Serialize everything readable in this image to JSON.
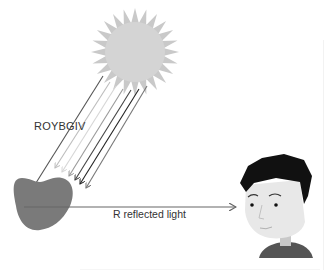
{
  "diagram": {
    "title": "",
    "labels": {
      "incoming_light": "ROYBGIV",
      "reflected_light": "R reflected light"
    },
    "elements": {
      "sun": {
        "name": "sun",
        "color": "#c8c8c8"
      },
      "apple": {
        "name": "apple",
        "color": "#7a7a7a"
      },
      "observer": {
        "name": "person-face",
        "hair_color": "#111111",
        "skin_color": "#e8e8e8",
        "shirt_color": "#555555"
      }
    },
    "rays": {
      "count": 7,
      "colors": [
        "#555555",
        "#bdbdbd",
        "#d6d6d6",
        "#9a9a9a",
        "#444444",
        "#222222",
        "#777777"
      ]
    },
    "reflected_ray": {
      "color": "#666666"
    }
  }
}
